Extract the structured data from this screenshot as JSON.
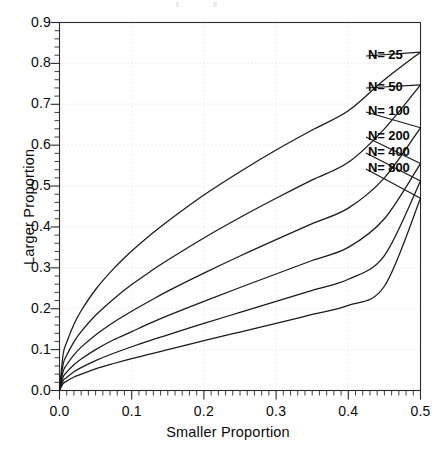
{
  "chart_data": {
    "type": "line",
    "title": "",
    "xlabel": "Smaller Proportion",
    "ylabel": "Larger Proportion",
    "xlim": [
      0.0,
      0.5
    ],
    "ylim": [
      0.0,
      0.9
    ],
    "xticks": [
      0.0,
      0.1,
      0.2,
      0.3,
      0.4,
      0.5
    ],
    "xtick_labels": [
      "0.0",
      "0.1",
      "0.2",
      "0.3",
      "0.4",
      "0.5"
    ],
    "yticks": [
      0.0,
      0.1,
      0.2,
      0.3,
      0.4,
      0.5,
      0.6,
      0.7,
      0.8,
      0.9
    ],
    "ytick_labels": [
      "0.0",
      "0.1",
      "0.2",
      "0.3",
      "0.4",
      "0.5",
      "0.6",
      "0.7",
      "0.8",
      "0.9"
    ],
    "grid": true,
    "grid_style": "dotted-faint",
    "legend_position": "inline-right-end-of-curve",
    "line_color": "#1a1a1a",
    "x": [
      0.0,
      0.005,
      0.01,
      0.02,
      0.03,
      0.05,
      0.075,
      0.1,
      0.125,
      0.15,
      0.2,
      0.25,
      0.3,
      0.35,
      0.4,
      0.45,
      0.5
    ],
    "series": [
      {
        "name": "N= 25",
        "label": "N= 25",
        "values": [
          0.0,
          0.088,
          0.118,
          0.162,
          0.195,
          0.247,
          0.298,
          0.341,
          0.379,
          0.414,
          0.478,
          0.535,
          0.588,
          0.637,
          0.684,
          0.76,
          0.8275
        ]
      },
      {
        "name": "N= 50",
        "label": "N= 50",
        "values": [
          0.0,
          0.064,
          0.086,
          0.119,
          0.144,
          0.184,
          0.224,
          0.259,
          0.29,
          0.319,
          0.373,
          0.423,
          0.47,
          0.515,
          0.558,
          0.64,
          0.7475
        ]
      },
      {
        "name": "N= 100",
        "label": "N= 100",
        "values": [
          0.0,
          0.046,
          0.063,
          0.087,
          0.106,
          0.136,
          0.167,
          0.194,
          0.219,
          0.243,
          0.287,
          0.329,
          0.369,
          0.408,
          0.446,
          0.52,
          0.6425
        ]
      },
      {
        "name": "N= 200",
        "label": "N= 200",
        "values": [
          0.0,
          0.033,
          0.045,
          0.063,
          0.077,
          0.1,
          0.124,
          0.144,
          0.164,
          0.183,
          0.218,
          0.252,
          0.285,
          0.318,
          0.35,
          0.42,
          0.555
        ]
      },
      {
        "name": "N= 400",
        "label": "N= 400",
        "values": [
          0.0,
          0.024,
          0.032,
          0.046,
          0.056,
          0.073,
          0.091,
          0.107,
          0.122,
          0.136,
          0.164,
          0.191,
          0.218,
          0.245,
          0.272,
          0.33,
          0.5125
        ]
      },
      {
        "name": "N= 800",
        "label": "N= 800",
        "values": [
          0.0,
          0.017,
          0.023,
          0.033,
          0.04,
          0.053,
          0.066,
          0.078,
          0.089,
          0.1,
          0.122,
          0.143,
          0.164,
          0.186,
          0.208,
          0.255,
          0.47
        ]
      }
    ],
    "label_anchor_points": [
      {
        "name": "N= 25",
        "x": 366,
        "y": 56
      },
      {
        "name": "N= 50",
        "x": 366,
        "y": 88
      },
      {
        "name": "N= 100",
        "x": 366,
        "y": 112
      },
      {
        "name": "N= 200",
        "x": 366,
        "y": 137
      },
      {
        "name": "N= 400",
        "x": 366,
        "y": 153
      },
      {
        "name": "N= 800",
        "x": 366,
        "y": 169
      }
    ]
  }
}
